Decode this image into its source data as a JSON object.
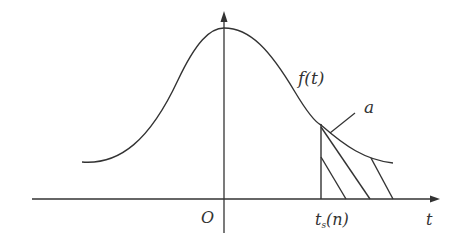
{
  "diagram": {
    "labels": {
      "curve": "f(t)",
      "region": "a",
      "origin": "O",
      "threshold": "t",
      "threshold_sub": "s",
      "threshold_arg": "(n)",
      "x_axis": "t"
    },
    "colors": {
      "stroke": "#333333",
      "background": "#ffffff"
    }
  }
}
